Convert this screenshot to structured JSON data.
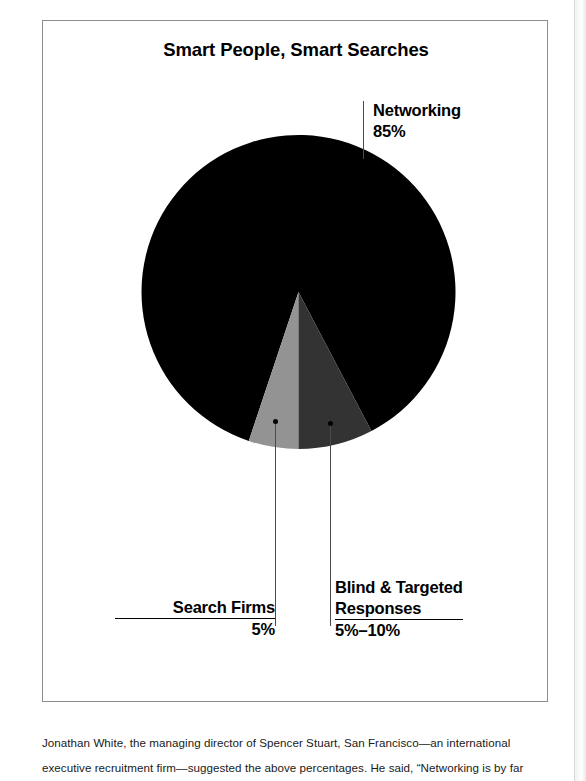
{
  "figure": {
    "title": "Smart People, Smart Searches"
  },
  "chart_data": {
    "type": "pie",
    "title": "Smart People, Smart Searches",
    "legend_position": "callouts",
    "grid": false,
    "categories": [
      "Networking",
      "Search Firms",
      "Blind & Targeted Responses"
    ],
    "values": [
      85,
      5,
      7.5
    ],
    "value_labels": [
      "85%",
      "5%",
      "5%–10%"
    ],
    "colors": [
      "#000000",
      "#939393",
      "#333333"
    ],
    "slices": [
      {
        "name": "Networking",
        "label": "Networking",
        "value_label": "85%",
        "value": 85,
        "color": "#000000",
        "start_angle_deg": 225,
        "sweep_deg": 306
      },
      {
        "name": "Search Firms",
        "label": "Search Firms",
        "value_label": "5%",
        "value": 5,
        "color": "#939393",
        "start_angle_deg": 171,
        "sweep_deg": 18
      },
      {
        "name": "Blind & Targeted Responses",
        "label": "Blind & Targeted Responses",
        "value_label": "5%–10%",
        "value": 7.5,
        "color": "#333333",
        "start_angle_deg": 189,
        "sweep_deg": 36
      }
    ]
  },
  "callouts": {
    "networking": {
      "label": "Networking",
      "percent": "85%"
    },
    "search_firms": {
      "label": "Search Firms",
      "percent": "5%"
    },
    "blind_targeted": {
      "label_line1": "Blind & Targeted",
      "label_line2": "Responses",
      "percent": "5%–10%"
    }
  },
  "caption": {
    "line1": "Jonathan White, the managing director of Spencer Stuart, San Francisco—an international",
    "line2": "executive recruitment firm—suggested the above percentages. He said, “Networking is by far"
  }
}
